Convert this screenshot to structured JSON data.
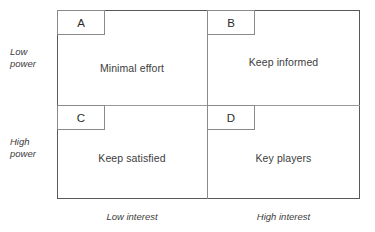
{
  "diagram": {
    "type": "power-interest-grid",
    "axes": {
      "y_low_line1": "Low",
      "y_low_line2": "power",
      "y_high_line1": "High",
      "y_high_line2": "power",
      "x_low": "Low interest",
      "x_high": "High interest"
    },
    "quadrants": [
      {
        "key": "A",
        "label": "Minimal effort",
        "power": "Low",
        "interest": "Low"
      },
      {
        "key": "B",
        "label": "Keep informed",
        "power": "Low",
        "interest": "High"
      },
      {
        "key": "C",
        "label": "Keep satisfied",
        "power": "High",
        "interest": "Low"
      },
      {
        "key": "D",
        "label": "Key players",
        "power": "High",
        "interest": "High"
      }
    ],
    "colors": {
      "frame": "#595959",
      "divider": "#8a8a8a",
      "text": "#3d3d3d",
      "background": "#ffffff"
    }
  }
}
